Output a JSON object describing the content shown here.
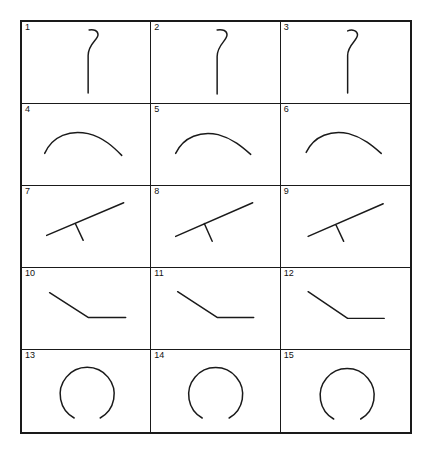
{
  "figure": {
    "columns": 3,
    "rows": 5,
    "stroke_color": "#1a1a1a",
    "border_color": "#1a1a1a",
    "background_color": "#ffffff"
  },
  "cells": [
    {
      "number": "1",
      "shape_name": "hook-stroke",
      "description": "vertical line with a small rightward hook curling at the top",
      "stroke_width": 1.5,
      "path": "M 62 72 L 62 34 C 62 22 72 18 72 13 C 72 9 68 7 63 8"
    },
    {
      "number": "2",
      "shape_name": "hook-stroke",
      "description": "vertical line with a small rightward hook curling at the top",
      "stroke_width": 1.5,
      "path": "M 62 73 L 62 35 C 62 23 72 19 72 13 C 72 9 68 7 62 8"
    },
    {
      "number": "3",
      "shape_name": "hook-stroke",
      "description": "vertical line with a small rightward hook curling at the top",
      "stroke_width": 1.5,
      "path": "M 62 72 L 62 34 C 62 23 72 19 72 13 C 72 9 67 7 62 9"
    },
    {
      "number": "4",
      "shape_name": "dome-arc-stroke",
      "description": "shallow downward-opening arc, apex left of center, trailing right",
      "stroke_width": 1.5,
      "path": "M 18 50 C 26 32 44 26 62 30 C 78 34 88 44 96 52"
    },
    {
      "number": "5",
      "shape_name": "dome-arc-stroke",
      "description": "shallow downward-opening arc, apex left of center, trailing right",
      "stroke_width": 1.5,
      "path": "M 20 50 C 28 33 46 27 63 31 C 78 35 88 44 96 51"
    },
    {
      "number": "6",
      "shape_name": "dome-arc-stroke",
      "description": "shallow downward-opening arc, apex left of center, trailing right",
      "stroke_width": 1.5,
      "path": "M 20 49 C 28 32 46 26 63 30 C 78 34 88 43 96 50"
    },
    {
      "number": "7",
      "shape_name": "diagonal-with-tick-stroke",
      "description": "rising diagonal line from lower-left to upper-right with a short tick descending from its midpoint",
      "stroke_width": 1.5,
      "path": "M 20 50 L 98 17 M 49 38 L 57 55"
    },
    {
      "number": "8",
      "shape_name": "diagonal-with-tick-stroke",
      "description": "rising diagonal line from lower-left to upper-right with a short tick descending from its midpoint",
      "stroke_width": 1.5,
      "path": "M 20 51 L 98 17 M 49 38 L 57 56"
    },
    {
      "number": "9",
      "shape_name": "diagonal-with-tick-stroke",
      "description": "rising diagonal line from lower-left to upper-right with a short tick descending from its midpoint",
      "stroke_width": 1.5,
      "path": "M 22 51 L 98 18 M 50 39 L 58 56"
    },
    {
      "number": "10",
      "shape_name": "descending-elbow-stroke",
      "description": "line descending from upper-left that bends into a horizontal segment toward the right",
      "stroke_width": 1.5,
      "path": "M 23 25 L 62 50 L 100 50"
    },
    {
      "number": "11",
      "shape_name": "descending-elbow-stroke",
      "description": "line descending from upper-left that bends into a horizontal segment toward the right",
      "stroke_width": 1.5,
      "path": "M 22 24 L 62 50 L 99 50"
    },
    {
      "number": "12",
      "shape_name": "descending-elbow-stroke",
      "description": "line descending from upper-left that bends into a horizontal segment toward the right",
      "stroke_width": 1.5,
      "path": "M 22 24 L 62 51 L 99 51"
    },
    {
      "number": "13",
      "shape_name": "open-circle-stroke",
      "description": "near-closed circle drawn with a gap at the bottom",
      "stroke_width": 1.5,
      "path": "M 48 68 A 27 27 0 1 1 74 68"
    },
    {
      "number": "14",
      "shape_name": "open-circle-stroke",
      "description": "near-closed circle drawn with a gap at the bottom",
      "stroke_width": 1.5,
      "path": "M 47 68 A 27 27 0 1 1 74 68"
    },
    {
      "number": "15",
      "shape_name": "open-circle-stroke",
      "description": "near-closed circle drawn with a gap at the bottom",
      "stroke_width": 1.5,
      "path": "M 48 69 A 27 27 0 1 1 75 69"
    }
  ]
}
